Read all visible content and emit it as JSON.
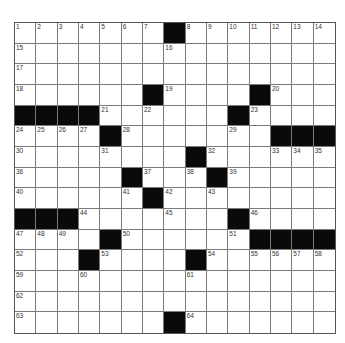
{
  "puzzle": {
    "rows": 15,
    "cols": 15,
    "colors": {
      "block": "#0a0a0a",
      "cell": "#ffffff",
      "line": "#7a7a7a"
    },
    "grid": [
      "....... #.......",
      "..............."
    ],
    "blocks": [
      [
        0,
        7
      ],
      [
        3,
        6
      ],
      [
        3,
        11
      ],
      [
        4,
        0
      ],
      [
        4,
        1
      ],
      [
        4,
        2
      ],
      [
        4,
        3
      ],
      [
        4,
        10
      ],
      [
        5,
        4
      ],
      [
        5,
        12
      ],
      [
        5,
        13
      ],
      [
        5,
        14
      ],
      [
        6,
        8
      ],
      [
        7,
        5
      ],
      [
        7,
        9
      ],
      [
        8,
        6
      ],
      [
        9,
        0
      ],
      [
        9,
        1
      ],
      [
        9,
        2
      ],
      [
        9,
        10
      ],
      [
        10,
        4
      ],
      [
        10,
        11
      ],
      [
        10,
        12
      ],
      [
        10,
        13
      ],
      [
        10,
        14
      ],
      [
        11,
        3
      ],
      [
        11,
        8
      ],
      [
        14,
        7
      ]
    ],
    "numbers": [
      {
        "r": 0,
        "c": 0,
        "n": "1"
      },
      {
        "r": 0,
        "c": 1,
        "n": "2"
      },
      {
        "r": 0,
        "c": 2,
        "n": "3"
      },
      {
        "r": 0,
        "c": 3,
        "n": "4"
      },
      {
        "r": 0,
        "c": 4,
        "n": "5"
      },
      {
        "r": 0,
        "c": 5,
        "n": "6"
      },
      {
        "r": 0,
        "c": 6,
        "n": "7"
      },
      {
        "r": 0,
        "c": 8,
        "n": "8"
      },
      {
        "r": 0,
        "c": 9,
        "n": "9"
      },
      {
        "r": 0,
        "c": 10,
        "n": "10"
      },
      {
        "r": 0,
        "c": 11,
        "n": "11"
      },
      {
        "r": 0,
        "c": 12,
        "n": "12"
      },
      {
        "r": 0,
        "c": 13,
        "n": "13"
      },
      {
        "r": 0,
        "c": 14,
        "n": "14"
      },
      {
        "r": 1,
        "c": 0,
        "n": "15"
      },
      {
        "r": 1,
        "c": 7,
        "n": "16"
      },
      {
        "r": 2,
        "c": 0,
        "n": "17"
      },
      {
        "r": 3,
        "c": 0,
        "n": "18"
      },
      {
        "r": 3,
        "c": 7,
        "n": "19"
      },
      {
        "r": 3,
        "c": 12,
        "n": "20"
      },
      {
        "r": 4,
        "c": 4,
        "n": "21"
      },
      {
        "r": 4,
        "c": 6,
        "n": "22"
      },
      {
        "r": 4,
        "c": 11,
        "n": "23"
      },
      {
        "r": 5,
        "c": 0,
        "n": "24"
      },
      {
        "r": 5,
        "c": 1,
        "n": "25"
      },
      {
        "r": 5,
        "c": 2,
        "n": "26"
      },
      {
        "r": 5,
        "c": 3,
        "n": "27"
      },
      {
        "r": 5,
        "c": 5,
        "n": "28"
      },
      {
        "r": 5,
        "c": 10,
        "n": "29"
      },
      {
        "r": 6,
        "c": 0,
        "n": "30"
      },
      {
        "r": 6,
        "c": 4,
        "n": "31"
      },
      {
        "r": 6,
        "c": 9,
        "n": "32"
      },
      {
        "r": 6,
        "c": 12,
        "n": "33"
      },
      {
        "r": 6,
        "c": 13,
        "n": "34"
      },
      {
        "r": 6,
        "c": 14,
        "n": "35"
      },
      {
        "r": 7,
        "c": 0,
        "n": "36"
      },
      {
        "r": 7,
        "c": 6,
        "n": "37"
      },
      {
        "r": 7,
        "c": 8,
        "n": "38"
      },
      {
        "r": 7,
        "c": 10,
        "n": "39"
      },
      {
        "r": 8,
        "c": 0,
        "n": "40"
      },
      {
        "r": 8,
        "c": 5,
        "n": "41"
      },
      {
        "r": 8,
        "c": 7,
        "n": "42"
      },
      {
        "r": 8,
        "c": 9,
        "n": "43"
      },
      {
        "r": 9,
        "c": 3,
        "n": "44"
      },
      {
        "r": 9,
        "c": 7,
        "n": "45"
      },
      {
        "r": 9,
        "c": 11,
        "n": "46"
      },
      {
        "r": 10,
        "c": 0,
        "n": "47"
      },
      {
        "r": 10,
        "c": 1,
        "n": "48"
      },
      {
        "r": 10,
        "c": 2,
        "n": "49"
      },
      {
        "r": 10,
        "c": 5,
        "n": "50"
      },
      {
        "r": 10,
        "c": 10,
        "n": "51"
      },
      {
        "r": 11,
        "c": 0,
        "n": "52"
      },
      {
        "r": 11,
        "c": 4,
        "n": "53"
      },
      {
        "r": 11,
        "c": 9,
        "n": "54"
      },
      {
        "r": 11,
        "c": 11,
        "n": "55"
      },
      {
        "r": 11,
        "c": 12,
        "n": "56"
      },
      {
        "r": 11,
        "c": 13,
        "n": "57"
      },
      {
        "r": 11,
        "c": 14,
        "n": "58"
      },
      {
        "r": 12,
        "c": 0,
        "n": "59"
      },
      {
        "r": 12,
        "c": 3,
        "n": "60"
      },
      {
        "r": 12,
        "c": 8,
        "n": "61"
      },
      {
        "r": 13,
        "c": 0,
        "n": "62"
      },
      {
        "r": 14,
        "c": 0,
        "n": "63"
      },
      {
        "r": 14,
        "c": 8,
        "n": "64"
      }
    ]
  }
}
